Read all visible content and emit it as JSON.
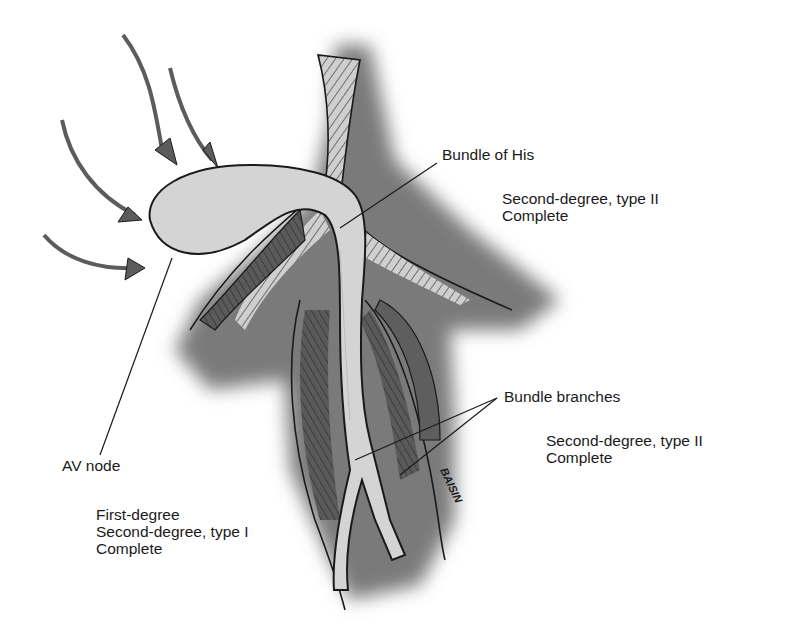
{
  "diagram": {
    "type": "anatomical illustration",
    "colors": {
      "background": "#ffffff",
      "shadow_tissue": "#7a7a7a",
      "pale_structure": "#d4d4d4",
      "outline": "#1a1a1a",
      "arrow": "#5c5c5c"
    },
    "arrows_count": 5
  },
  "labels": {
    "bundle_of_his": "Bundle of His",
    "av_node": "AV node",
    "bundle_branches": "Bundle branches"
  },
  "annotations": {
    "his_blocks": [
      "Second-degree, type II",
      "Complete"
    ],
    "av_node_blocks": [
      "First-degree",
      "Second-degree, type I",
      "Complete"
    ],
    "branch_blocks": [
      "Second-degree, type II",
      "Complete"
    ]
  },
  "signature": "BAISIN"
}
